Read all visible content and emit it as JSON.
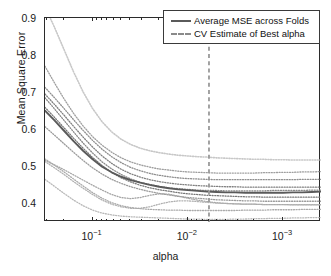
{
  "chart_data": {
    "type": "line",
    "title": "",
    "xlabel": "alpha",
    "ylabel": "Mean Square Error",
    "xscale": "log",
    "x_reversed": true,
    "xlim": [
      0.316,
      0.0004
    ],
    "ylim": [
      0.355,
      0.905
    ],
    "yticks": [
      0.4,
      0.5,
      0.6,
      0.7,
      0.8,
      0.9
    ],
    "ytick_labels": [
      "0.4",
      "0.5",
      "0.6",
      "0.7",
      "0.8",
      "0.9"
    ],
    "xticks": [
      0.1,
      0.01,
      0.001
    ],
    "xtick_labels": [
      "10-1",
      "10-2",
      "10-3"
    ],
    "xtick_mantissas": [
      "10",
      "10",
      "10"
    ],
    "xtick_exponents": [
      "-1",
      "-2",
      "-3"
    ],
    "grid": false,
    "legend_position": "top-right",
    "legend": [
      {
        "label": "Average MSE across Folds",
        "style": "solid",
        "color": "#5a5a5a"
      },
      {
        "label": "CV Estimate of Best alpha",
        "style": "dashed",
        "color": "#8a8a8a"
      }
    ],
    "annotations": [
      {
        "name": "cv-best-alpha-line",
        "type": "vline",
        "x": 0.006,
        "style": "dashed",
        "color": "#9a9a9a"
      }
    ],
    "x": [
      0.3162,
      0.2512,
      0.1995,
      0.1585,
      0.1259,
      0.1,
      0.0794,
      0.0631,
      0.0501,
      0.0398,
      0.0316,
      0.0251,
      0.02,
      0.0158,
      0.0126,
      0.01,
      0.0079,
      0.0063,
      0.005,
      0.004,
      0.0032,
      0.0025,
      0.002,
      0.0016,
      0.0013,
      0.001,
      0.00079,
      0.00063,
      0.0005,
      0.0004
    ],
    "series": [
      {
        "name": "Average MSE across Folds",
        "style": "solid",
        "color": "#5a5a5a",
        "width": 1.9,
        "values": [
          0.655,
          0.629,
          0.601,
          0.573,
          0.547,
          0.524,
          0.504,
          0.489,
          0.477,
          0.468,
          0.461,
          0.455,
          0.45,
          0.446,
          0.443,
          0.441,
          0.439,
          0.437,
          0.436,
          0.435,
          0.435,
          0.434,
          0.434,
          0.434,
          0.434,
          0.434,
          0.435,
          0.435,
          0.436,
          0.437
        ]
      },
      {
        "name": "fold-1",
        "style": "dotted",
        "color": "#c8c8c8",
        "width": 1.6,
        "values": [
          0.935,
          0.88,
          0.82,
          0.76,
          0.706,
          0.661,
          0.625,
          0.598,
          0.578,
          0.564,
          0.554,
          0.547,
          0.542,
          0.538,
          0.535,
          0.533,
          0.531,
          0.53,
          0.528,
          0.527,
          0.526,
          0.525,
          0.524,
          0.524,
          0.523,
          0.523,
          0.522,
          0.522,
          0.522,
          0.522
        ]
      },
      {
        "name": "fold-2",
        "style": "dotted",
        "color": "#9e9e9e",
        "width": 1.3,
        "values": [
          0.775,
          0.73,
          0.687,
          0.648,
          0.614,
          0.585,
          0.562,
          0.543,
          0.528,
          0.517,
          0.509,
          0.503,
          0.498,
          0.495,
          0.492,
          0.49,
          0.489,
          0.488,
          0.487,
          0.487,
          0.487,
          0.487,
          0.487,
          0.488,
          0.488,
          0.489,
          0.489,
          0.49,
          0.49,
          0.491
        ]
      },
      {
        "name": "fold-3",
        "style": "dotted",
        "color": "#8e8e8e",
        "width": 1.3,
        "values": [
          0.718,
          0.69,
          0.661,
          0.631,
          0.602,
          0.575,
          0.551,
          0.531,
          0.515,
          0.502,
          0.493,
          0.486,
          0.481,
          0.477,
          0.474,
          0.472,
          0.471,
          0.47,
          0.469,
          0.469,
          0.469,
          0.469,
          0.469,
          0.469,
          0.469,
          0.469,
          0.469,
          0.47,
          0.47,
          0.47
        ]
      },
      {
        "name": "fold-4",
        "style": "dotted",
        "color": "#7f7f7f",
        "width": 1.3,
        "values": [
          0.7,
          0.672,
          0.643,
          0.613,
          0.584,
          0.557,
          0.533,
          0.513,
          0.497,
          0.485,
          0.476,
          0.469,
          0.464,
          0.46,
          0.457,
          0.455,
          0.453,
          0.452,
          0.451,
          0.45,
          0.45,
          0.449,
          0.449,
          0.449,
          0.449,
          0.449,
          0.449,
          0.449,
          0.449,
          0.449
        ]
      },
      {
        "name": "fold-5",
        "style": "dotted",
        "color": "#888888",
        "width": 1.3,
        "values": [
          0.69,
          0.66,
          0.629,
          0.598,
          0.568,
          0.541,
          0.517,
          0.498,
          0.483,
          0.471,
          0.462,
          0.456,
          0.451,
          0.447,
          0.445,
          0.443,
          0.441,
          0.44,
          0.44,
          0.439,
          0.439,
          0.439,
          0.439,
          0.439,
          0.44,
          0.44,
          0.44,
          0.44,
          0.441,
          0.441
        ]
      },
      {
        "name": "fold-6",
        "style": "dotted",
        "color": "#777777",
        "width": 1.3,
        "values": [
          0.664,
          0.637,
          0.609,
          0.581,
          0.554,
          0.529,
          0.507,
          0.489,
          0.474,
          0.463,
          0.454,
          0.447,
          0.442,
          0.438,
          0.434,
          0.431,
          0.429,
          0.427,
          0.426,
          0.425,
          0.424,
          0.423,
          0.423,
          0.422,
          0.422,
          0.422,
          0.422,
          0.422,
          0.422,
          0.422
        ]
      },
      {
        "name": "fold-7",
        "style": "dotted",
        "color": "#9a9a9a",
        "width": 1.3,
        "values": [
          0.612,
          0.589,
          0.566,
          0.543,
          0.521,
          0.501,
          0.484,
          0.47,
          0.459,
          0.45,
          0.443,
          0.437,
          0.432,
          0.428,
          0.424,
          0.421,
          0.419,
          0.417,
          0.415,
          0.414,
          0.413,
          0.412,
          0.412,
          0.411,
          0.411,
          0.411,
          0.411,
          0.411,
          0.411,
          0.411
        ]
      },
      {
        "name": "fold-8",
        "style": "dotted",
        "color": "#a5a5a5",
        "width": 1.3,
        "values": [
          0.521,
          0.509,
          0.496,
          0.482,
          0.468,
          0.454,
          0.441,
          0.429,
          0.421,
          0.418,
          0.421,
          0.427,
          0.431,
          0.43,
          0.425,
          0.419,
          0.414,
          0.41,
          0.407,
          0.405,
          0.404,
          0.403,
          0.403,
          0.402,
          0.402,
          0.402,
          0.401,
          0.401,
          0.401,
          0.401
        ]
      },
      {
        "name": "fold-9",
        "style": "dotted",
        "color": "#b0b0b0",
        "width": 1.3,
        "values": [
          0.518,
          0.501,
          0.483,
          0.464,
          0.446,
          0.429,
          0.414,
          0.403,
          0.396,
          0.392,
          0.392,
          0.396,
          0.403,
          0.409,
          0.412,
          0.412,
          0.41,
          0.408,
          0.406,
          0.405,
          0.404,
          0.403,
          0.403,
          0.402,
          0.402,
          0.402,
          0.402,
          0.402,
          0.402,
          0.402
        ]
      },
      {
        "name": "fold-10",
        "style": "dotted",
        "color": "#b8b8b8",
        "width": 1.3,
        "values": [
          0.47,
          0.451,
          0.432,
          0.414,
          0.399,
          0.387,
          0.379,
          0.374,
          0.371,
          0.369,
          0.368,
          0.367,
          0.366,
          0.365,
          0.364,
          0.363,
          0.363,
          0.362,
          0.362,
          0.362,
          0.363,
          0.363,
          0.364,
          0.364,
          0.365,
          0.365,
          0.366,
          0.366,
          0.367,
          0.367
        ]
      },
      {
        "name": "fold-11",
        "style": "dotted",
        "color": "#aaaaaa",
        "width": 1.3,
        "values": [
          0.525,
          0.508,
          0.49,
          0.471,
          0.452,
          0.434,
          0.419,
          0.407,
          0.399,
          0.394,
          0.391,
          0.389,
          0.388,
          0.387,
          0.387,
          0.386,
          0.386,
          0.386,
          0.386,
          0.386,
          0.386,
          0.387,
          0.387,
          0.387,
          0.388,
          0.388,
          0.388,
          0.389,
          0.389,
          0.389
        ]
      }
    ]
  },
  "axes": {
    "y_label": "Mean Square Error",
    "x_label": "alpha"
  }
}
